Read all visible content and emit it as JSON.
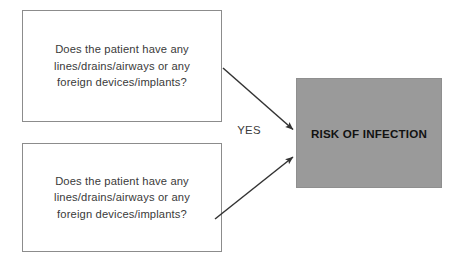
{
  "diagram": {
    "title_text": "RISK OF INFECTION",
    "edge_label": "YES",
    "question_top": "Does the patient have any\nlines/drains/airways or any\nforeign devices/implants?",
    "question_bottom": "Does the patient have any\nlines/drains/airways or any\nforeign devices/implants?",
    "colors": {
      "risk_fill": "#9a9a9a",
      "box_border": "#8c8c8c",
      "text": "#3a3a3a",
      "risk_text": "#121212",
      "arrow": "#333333",
      "background": "#ffffff"
    }
  }
}
